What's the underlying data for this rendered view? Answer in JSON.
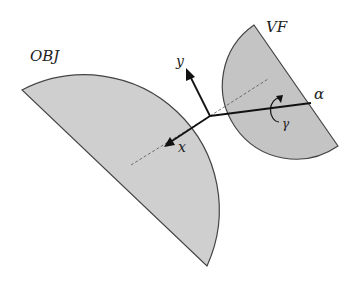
{
  "diagram": {
    "labels": {
      "obj": "OBJ",
      "vf": "VF",
      "y_axis": "y",
      "x_axis": "x",
      "alpha": "α",
      "gamma": "γ"
    },
    "colors": {
      "obj_fill": "#cfcfcf",
      "vf_fill": "#c4c4c4",
      "outline": "#444444",
      "axis": "#111111",
      "dashed": "#555555"
    }
  }
}
